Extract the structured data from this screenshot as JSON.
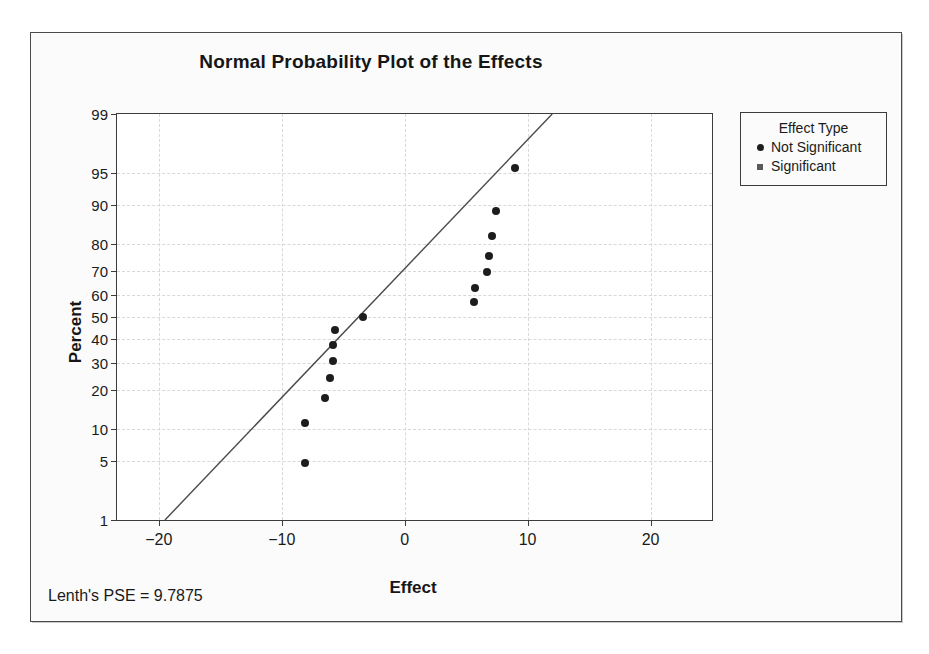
{
  "chart": {
    "title": "Normal Probability Plot of the Effects",
    "footnote": "Lenth's PSE = 9.7875",
    "xlabel": "Effect",
    "ylabel": "Percent"
  },
  "legend": {
    "title": "Effect Type",
    "entries": [
      {
        "label": "Not Significant",
        "marker": "circle-marker"
      },
      {
        "label": "Significant",
        "marker": "square-marker"
      }
    ]
  },
  "axes": {
    "y_ticks": [
      "99",
      "95",
      "90",
      "80",
      "70",
      "60",
      "50",
      "40",
      "30",
      "20",
      "10",
      "5",
      "1"
    ],
    "x_ticks": [
      "-20",
      "-10",
      "0",
      "10",
      "20"
    ]
  },
  "chart_data": {
    "type": "scatter",
    "title": "Normal Probability Plot of the Effects",
    "xlabel": "Effect",
    "ylabel": "Percent",
    "xlim": [
      -23.4,
      25.0
    ],
    "ylim": [
      1,
      99
    ],
    "y_scale": "normal-probability",
    "y_ticks": [
      1,
      5,
      10,
      20,
      30,
      40,
      50,
      60,
      70,
      80,
      90,
      95,
      99
    ],
    "x_ticks": [
      -20,
      -10,
      0,
      10,
      20
    ],
    "grid": true,
    "legend_position": "right",
    "annotations": [
      "Lenth's PSE = 9.7875"
    ],
    "reference_line": {
      "label": "normal-fit-line",
      "x_start": -19.5,
      "y_start": 1,
      "x_end": 12.0,
      "y_end": 99
    },
    "series": [
      {
        "name": "Not Significant",
        "marker": "circle",
        "points": [
          {
            "x": -8.1,
            "percent": 4.7
          },
          {
            "x": -8.1,
            "percent": 11.2
          },
          {
            "x": -6.5,
            "percent": 17.8
          },
          {
            "x": -6.1,
            "percent": 24.3
          },
          {
            "x": -5.8,
            "percent": 30.9
          },
          {
            "x": -5.8,
            "percent": 37.5
          },
          {
            "x": -5.7,
            "percent": 44.1
          },
          {
            "x": -3.4,
            "percent": 50.0
          },
          {
            "x": 5.6,
            "percent": 56.6
          },
          {
            "x": 5.7,
            "percent": 63.2
          },
          {
            "x": 6.7,
            "percent": 69.8
          },
          {
            "x": 6.9,
            "percent": 75.7
          },
          {
            "x": 7.1,
            "percent": 82.2
          },
          {
            "x": 7.4,
            "percent": 88.8
          },
          {
            "x": 9.0,
            "percent": 95.6
          }
        ]
      },
      {
        "name": "Significant",
        "marker": "square",
        "points": []
      }
    ]
  }
}
